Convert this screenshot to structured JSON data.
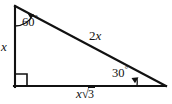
{
  "figure": {
    "type": "geometry-diagram",
    "shape": "right-triangle",
    "background_color": "#ffffff",
    "stroke_color": "#111111"
  },
  "labels": {
    "leg_vertical": "x",
    "hypotenuse": "2x",
    "base_prefix": "x",
    "base_radical_sign": "√",
    "base_radicand": "3",
    "base_full": "x√3",
    "angle_top": "60",
    "angle_top_unit": "°",
    "angle_bottom_right": "30",
    "angle_bottom_right_unit": "°",
    "right_angle_marker": "square"
  },
  "geometry": {
    "vertex_top": {
      "x": 14,
      "y": 6
    },
    "vertex_bottom_left": {
      "x": 14,
      "y": 87
    },
    "vertex_bottom_right": {
      "x": 166,
      "y": 87
    },
    "angles_degrees": {
      "top": 60,
      "bottom_left": 90,
      "bottom_right": 30
    },
    "side_lengths_symbolic": {
      "opposite_30": "x",
      "opposite_60": "x√3",
      "hypotenuse": "2x"
    }
  }
}
